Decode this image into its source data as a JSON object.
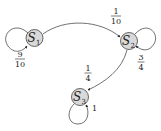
{
  "diagram": {
    "type": "markov-chain",
    "states": [
      {
        "id": "S1",
        "letter": "S",
        "sub": "1"
      },
      {
        "id": "S2",
        "letter": "S",
        "sub": "2"
      },
      {
        "id": "S3",
        "letter": "S",
        "sub": "3"
      }
    ],
    "transitions": [
      {
        "from": "S1",
        "to": "S1",
        "num": "9",
        "den": "10"
      },
      {
        "from": "S1",
        "to": "S2",
        "num": "1",
        "den": "10"
      },
      {
        "from": "S2",
        "to": "S2",
        "num": "3",
        "den": "4"
      },
      {
        "from": "S2",
        "to": "S3",
        "num": "1",
        "den": "4"
      },
      {
        "from": "S3",
        "to": "S3",
        "label": "1"
      }
    ],
    "colors": {
      "node_fill": "#d9d9d9",
      "stroke": "#333333"
    }
  }
}
